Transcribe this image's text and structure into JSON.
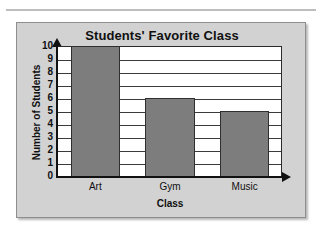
{
  "chart_data": {
    "type": "bar",
    "title": "Students' Favorite Class",
    "categories": [
      "Art",
      "Gym",
      "Music"
    ],
    "values": [
      10,
      6,
      5
    ],
    "xlabel": "Class",
    "ylabel": "Number of Students",
    "ylim": [
      0,
      10
    ],
    "ytick_labels": [
      "10",
      "9",
      "8",
      "7",
      "6",
      "5",
      "4",
      "3",
      "2",
      "1",
      "0"
    ],
    "ytick_values": [
      10,
      9,
      8,
      7,
      6,
      5,
      4,
      3,
      2,
      1,
      0
    ],
    "grid": "horizontal",
    "legend": "none",
    "bar_color": "#7d7d7d",
    "panel_color": "#d2d2d2",
    "plot_background": "#ffffff",
    "axis_color": "#111111"
  }
}
